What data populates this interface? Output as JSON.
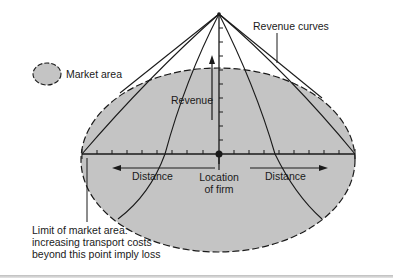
{
  "figure": {
    "legend": {
      "swatch": "market-area-swatch",
      "label": "Market area"
    },
    "labels": {
      "revenue_curves": "Revenue curves",
      "revenue_axis": "Revenue",
      "distance_left": "Distance",
      "distance_right": "Distance",
      "location_line1": "Location",
      "location_line2": "of firm",
      "limit_line1": "Limit of market area:",
      "limit_line2": "increasing transport costs",
      "limit_line3": "beyond this point imply loss"
    },
    "colors": {
      "market_fill": "#c4c4c4",
      "line": "#1a1a1a",
      "background": "#ffffff"
    },
    "geometry": {
      "apex": [
        219,
        14
      ],
      "firm_location": [
        219,
        154
      ],
      "market_ellipse": {
        "cx": 218,
        "cy": 160,
        "rx": 137,
        "ry": 92
      }
    }
  }
}
